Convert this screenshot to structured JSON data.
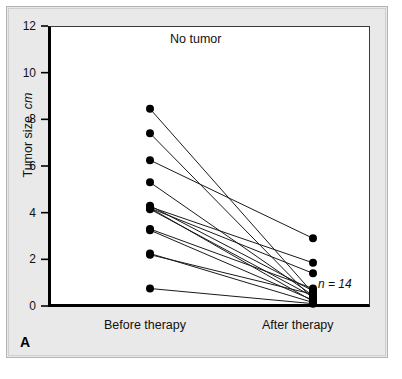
{
  "figure": {
    "panel_letter": "A",
    "title": "No tumor",
    "sample_annotation": "n = 14",
    "y_axis_title_main": "Tumor size, ",
    "y_axis_title_italic": "cm"
  },
  "chart_data": {
    "type": "line",
    "subtype": "paired-slope-chart",
    "title": "No tumor",
    "xlabel": "",
    "ylabel": "Tumor size, cm",
    "categories": [
      "Before therapy",
      "After therapy"
    ],
    "tick_labels": [
      "0",
      "2",
      "4",
      "6",
      "8",
      "10",
      "12"
    ],
    "ticks": [
      0,
      2,
      4,
      6,
      8,
      10,
      12
    ],
    "ylim": [
      0,
      12
    ],
    "grid": false,
    "legend": null,
    "n": 14,
    "annotations": [
      {
        "text": "No tumor",
        "x": "center",
        "y": 11.4
      },
      {
        "text": "n = 14",
        "x": "After therapy",
        "y": 1.0
      }
    ],
    "marker": {
      "shape": "circle",
      "color": "#000000",
      "size": 4
    },
    "line_color": "#1a1a1a",
    "series": [
      {
        "name": "Patient 1",
        "values": [
          8.45,
          0.55
        ]
      },
      {
        "name": "Patient 2",
        "values": [
          7.4,
          0.3
        ]
      },
      {
        "name": "Patient 3",
        "values": [
          6.25,
          2.9
        ]
      },
      {
        "name": "Patient 4",
        "values": [
          5.3,
          0.45
        ]
      },
      {
        "name": "Patient 5",
        "values": [
          4.3,
          0.65
        ]
      },
      {
        "name": "Patient 6",
        "values": [
          4.25,
          1.85
        ]
      },
      {
        "name": "Patient 7",
        "values": [
          4.2,
          0.2
        ]
      },
      {
        "name": "Patient 8",
        "values": [
          4.2,
          1.4
        ]
      },
      {
        "name": "Patient 9",
        "values": [
          4.15,
          0.4
        ]
      },
      {
        "name": "Patient 10",
        "values": [
          3.3,
          0.75
        ]
      },
      {
        "name": "Patient 11",
        "values": [
          3.25,
          0.25
        ]
      },
      {
        "name": "Patient 12",
        "values": [
          2.25,
          0.15
        ]
      },
      {
        "name": "Patient 13",
        "values": [
          2.2,
          0.5
        ]
      },
      {
        "name": "Patient 14",
        "values": [
          0.75,
          0.1
        ]
      }
    ]
  }
}
